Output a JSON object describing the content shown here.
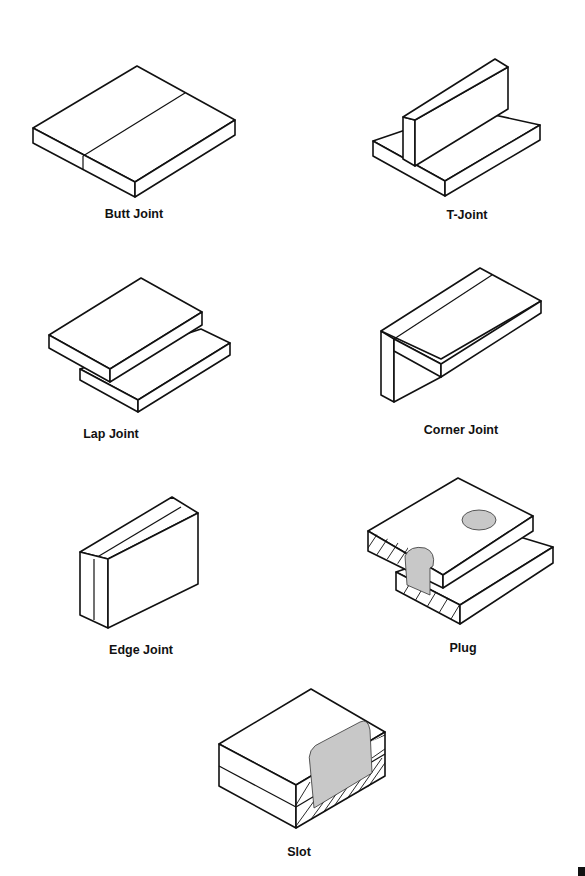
{
  "figures": [
    {
      "id": "butt",
      "label": "Butt Joint"
    },
    {
      "id": "t",
      "label": "T-Joint"
    },
    {
      "id": "lap",
      "label": "Lap Joint"
    },
    {
      "id": "corner",
      "label": "Corner Joint"
    },
    {
      "id": "edge",
      "label": "Edge Joint"
    },
    {
      "id": "plug",
      "label": "Plug"
    },
    {
      "id": "slot",
      "label": "Slot"
    }
  ],
  "colors": {
    "line": "#111111",
    "weld_fill": "#c8c8c8",
    "background": "#ffffff"
  }
}
